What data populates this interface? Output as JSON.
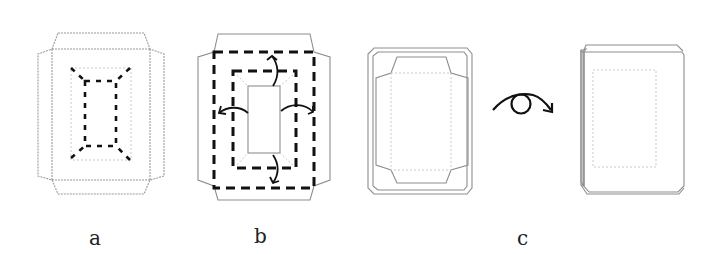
{
  "diagram": {
    "type": "folding-instructions",
    "stroke_color": "#111111",
    "outline_color": "#9a9a9a",
    "steps": [
      {
        "id": "a",
        "label": "a",
        "description": "flat net with dashed inner fold lines and diagonal corner creases"
      },
      {
        "id": "b",
        "label": "b",
        "description": "outer and inner dashed fold rectangles with four curved arrows folding flaps outward"
      },
      {
        "id": "c",
        "label": "c",
        "description": "folded frame, then rotation symbol (flip over) to show the back side"
      }
    ],
    "symbols": [
      {
        "name": "flip-over-rotation",
        "description": "curved arrow passing over a circle"
      }
    ]
  }
}
